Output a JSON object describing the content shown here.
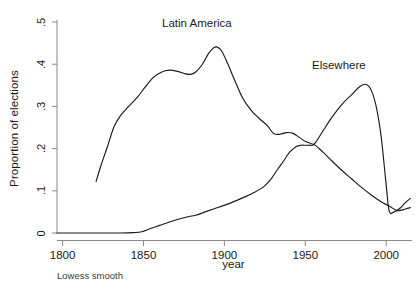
{
  "figure": {
    "footnote": "Lowess smooth",
    "background_color": "#ffffff",
    "line_color": "#1a1a1a",
    "axis_color": "#8a8a8a"
  },
  "axes": {
    "x_title": "year",
    "y_title": "Proportion of elections",
    "x_ticks": [
      "1800",
      "1850",
      "1900",
      "1950",
      "2000"
    ],
    "y_ticks": [
      "0",
      ".1",
      ".2",
      ".3",
      ".4",
      ".5"
    ]
  },
  "annotations": {
    "latin_america": "Latin America",
    "elsewhere": "Elsewhere"
  },
  "chart_data": {
    "type": "line",
    "title": "",
    "subtitle": "",
    "xlabel": "year",
    "ylabel": "Proportion of elections",
    "xlim": [
      1791,
      2009
    ],
    "ylim": [
      0,
      0.5
    ],
    "xticks": [
      1800,
      1850,
      1900,
      1950,
      2000
    ],
    "yticks": [
      0,
      0.1,
      0.2,
      0.3,
      0.4,
      0.5
    ],
    "ytick_labels": [
      "0",
      ".1",
      ".2",
      ".3",
      ".4",
      ".5"
    ],
    "grid": false,
    "legend_position": "inline-annotations",
    "note": "Lowess smooth",
    "series": [
      {
        "name": "Latin America",
        "label_position": {
          "x": 1880,
          "y": 0.49
        },
        "x": [
          1815,
          1818,
          1822,
          1826,
          1830,
          1835,
          1840,
          1845,
          1850,
          1855,
          1860,
          1865,
          1870,
          1873,
          1876,
          1880,
          1884,
          1887,
          1889,
          1892,
          1896,
          1900,
          1905,
          1910,
          1915,
          1920,
          1924,
          1928,
          1932,
          1936,
          1940,
          1944,
          1949,
          1954,
          1960,
          1966,
          1972,
          1978,
          1984,
          1990,
          1995,
          2000,
          2005,
          2008
        ],
        "y": [
          0.122,
          0.16,
          0.205,
          0.252,
          0.278,
          0.3,
          0.32,
          0.345,
          0.368,
          0.381,
          0.386,
          0.383,
          0.377,
          0.376,
          0.381,
          0.398,
          0.425,
          0.438,
          0.441,
          0.432,
          0.4,
          0.363,
          0.32,
          0.292,
          0.272,
          0.255,
          0.236,
          0.234,
          0.238,
          0.236,
          0.226,
          0.216,
          0.209,
          0.193,
          0.17,
          0.148,
          0.128,
          0.108,
          0.09,
          0.074,
          0.064,
          0.053,
          0.057,
          0.06
        ]
      },
      {
        "name": "Elsewhere",
        "label_position": {
          "x": 1968,
          "y": 0.4
        },
        "x": [
          1791,
          1800,
          1810,
          1820,
          1830,
          1838,
          1843,
          1848,
          1854,
          1860,
          1866,
          1872,
          1876,
          1882,
          1888,
          1894,
          1900,
          1906,
          1912,
          1918,
          1922,
          1926,
          1930,
          1934,
          1938,
          1941,
          1945,
          1949,
          1954,
          1960,
          1966,
          1972,
          1977,
          1981,
          1984,
          1987,
          1990,
          1993,
          1995,
          1998,
          2002,
          2005,
          2008
        ],
        "y": [
          0.0,
          0.0,
          0.0,
          0.0,
          0.0,
          0.001,
          0.003,
          0.01,
          0.018,
          0.026,
          0.033,
          0.039,
          0.042,
          0.05,
          0.058,
          0.066,
          0.075,
          0.085,
          0.096,
          0.11,
          0.126,
          0.148,
          0.17,
          0.192,
          0.205,
          0.208,
          0.208,
          0.211,
          0.24,
          0.275,
          0.305,
          0.328,
          0.347,
          0.352,
          0.338,
          0.3,
          0.23,
          0.12,
          0.052,
          0.05,
          0.06,
          0.072,
          0.082
        ]
      }
    ]
  }
}
